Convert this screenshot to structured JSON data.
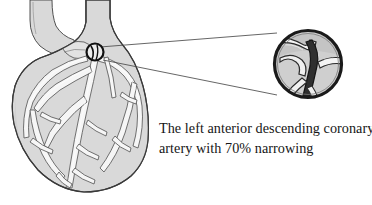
{
  "figure": {
    "type": "medical-illustration",
    "background_color": "#ffffff",
    "heart": {
      "name": "heart-anterior-view",
      "fill_color": "#d9d9d9",
      "outline_color": "#3a3a3a",
      "vessel_fill_color": "#f4f4f4",
      "vessel_outline_color": "#555555",
      "great_vessels": [
        "aorta",
        "pulmonary-artery"
      ]
    },
    "stenosis_marker": {
      "name": "stenosis-site-marker",
      "shape": "circle",
      "color": "#111111",
      "center_x": 95,
      "center_y": 52,
      "radius": 8
    },
    "magnifier": {
      "name": "magnified-artery-inset",
      "shape": "circle",
      "center_x": 308,
      "center_y": 64,
      "radius": 36,
      "ring_color": "#1a1a1a",
      "interior_fill": "#cfcfcf",
      "narrowing_color": "#2a2a2a",
      "leader_line_color": "#4a4a4a"
    }
  },
  "caption": {
    "line1": "The left anterior descending coronary",
    "line2": "artery with 70% narrowing",
    "full_text": "The left anterior descending coronary artery with 70% narrowing",
    "narrowing_percent": "70%",
    "artery_name": "left anterior descending coronary artery",
    "text_color": "#161616"
  }
}
